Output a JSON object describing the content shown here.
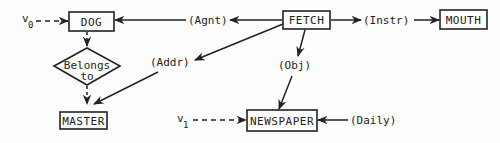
{
  "diagram": {
    "type": "conceptual-graph",
    "colors": {
      "ink": "#222222",
      "background": "#fdfdfd"
    },
    "concepts": {
      "dog": "DOG",
      "fetch": "FETCH",
      "mouth": "MOUTH",
      "master": "MASTER",
      "newspaper": "NEWSPAPER"
    },
    "relations": {
      "agnt": "(Agnt)",
      "instr": "(Instr)",
      "addr": "(Addr)",
      "obj": "(Obj)",
      "daily": "(Daily)"
    },
    "diamond": {
      "line1": "Belongs",
      "line2": "to"
    },
    "variables": {
      "v0": {
        "base": "v",
        "sub": "0"
      },
      "v1": {
        "base": "v",
        "sub": "1"
      }
    },
    "edges": [
      {
        "from": "v0",
        "to": "DOG",
        "style": "dashed"
      },
      {
        "from": "FETCH",
        "to": "(Agnt)",
        "style": "solid"
      },
      {
        "from": "(Agnt)",
        "to": "DOG",
        "style": "solid"
      },
      {
        "from": "FETCH",
        "to": "(Instr)",
        "style": "solid"
      },
      {
        "from": "(Instr)",
        "to": "MOUTH",
        "style": "solid"
      },
      {
        "from": "FETCH",
        "to": "(Addr)",
        "style": "solid"
      },
      {
        "from": "(Addr)",
        "to": "MASTER",
        "style": "solid"
      },
      {
        "from": "FETCH",
        "to": "(Obj)",
        "style": "solid"
      },
      {
        "from": "(Obj)",
        "to": "NEWSPAPER",
        "style": "solid"
      },
      {
        "from": "DOG",
        "to": "Belongs to",
        "style": "dashed"
      },
      {
        "from": "Belongs to",
        "to": "MASTER",
        "style": "dashed"
      },
      {
        "from": "v1",
        "to": "NEWSPAPER",
        "style": "dashed"
      },
      {
        "from": "(Daily)",
        "to": "NEWSPAPER",
        "style": "solid"
      }
    ]
  }
}
